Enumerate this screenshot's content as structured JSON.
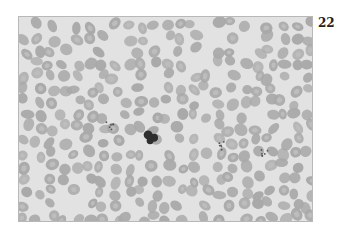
{
  "figure": {
    "number": "22",
    "colors": {
      "background": "#e2e2e2",
      "rbc": "#a9a9a9",
      "rbc_center": "#bdbdbd",
      "nucleus": "#2f2f2f"
    }
  }
}
